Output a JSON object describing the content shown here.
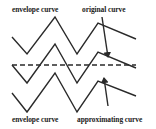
{
  "labels": {
    "top_left": "envelope curve",
    "top_right": "original curve",
    "bottom_left": "envelope curve",
    "bottom_right": "approximating curve"
  },
  "colors": {
    "line": "#2a2a2a",
    "background": "#ffffff"
  },
  "curves": {
    "upper_envelope": "12,37 27,54 55,17 77,54 98,23 136,39",
    "original": "12,65 27,83 55,44 77,83 98,52 136,68",
    "approximating_dashed": "12,65 136,65",
    "lower_envelope": "12,93 27,112 55,73 77,112 98,81 136,96"
  },
  "arrows": {
    "original_arrow": {
      "from": "102,17",
      "to": "108,57"
    },
    "approximating_arrow": {
      "from": "108,106",
      "to": "104,78"
    }
  }
}
